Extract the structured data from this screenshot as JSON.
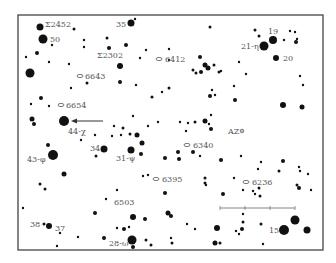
{
  "chart_title": "Star field finder chart",
  "frame": {
    "x": 18,
    "y": 15,
    "w": 305,
    "h": 235,
    "stroke": "#444444"
  },
  "colors": {
    "star": "#111111",
    "label": "#555555",
    "arrow": "#333333",
    "scale": "#777777"
  },
  "labels": [
    {
      "text": "Σ2452",
      "x": 45,
      "y": 27
    },
    {
      "text": "50",
      "x": 50,
      "y": 42
    },
    {
      "text": "35",
      "x": 116,
      "y": 27
    },
    {
      "text": "Σ2302",
      "x": 97,
      "y": 58
    },
    {
      "text": "6412",
      "x": 165,
      "y": 62
    },
    {
      "text": "19",
      "x": 268,
      "y": 34
    },
    {
      "text": "21-η",
      "x": 241,
      "y": 49
    },
    {
      "text": "20",
      "x": 283,
      "y": 61
    },
    {
      "text": "6643",
      "x": 85,
      "y": 79
    },
    {
      "text": "6654",
      "x": 66,
      "y": 108
    },
    {
      "text": "44-χ",
      "x": 68,
      "y": 134
    },
    {
      "text": "AZ",
      "x": 228,
      "y": 134
    },
    {
      "text": "34",
      "x": 90,
      "y": 151
    },
    {
      "text": "31-ψ",
      "x": 116,
      "y": 161
    },
    {
      "text": "6340",
      "x": 193,
      "y": 148
    },
    {
      "text": "43-φ",
      "x": 27,
      "y": 162
    },
    {
      "text": "6395",
      "x": 162,
      "y": 182
    },
    {
      "text": "6236",
      "x": 252,
      "y": 185
    },
    {
      "text": "6503",
      "x": 114,
      "y": 205
    },
    {
      "text": "38",
      "x": 30,
      "y": 227
    },
    {
      "text": "37",
      "x": 55,
      "y": 231
    },
    {
      "text": "15",
      "x": 269,
      "y": 233
    },
    {
      "text": "28-ω",
      "x": 109,
      "y": 246
    }
  ],
  "nebulae": [
    {
      "id": "6643",
      "x": 80,
      "y": 76
    },
    {
      "id": "6654",
      "x": 61,
      "y": 105
    },
    {
      "id": "6340",
      "x": 187,
      "y": 145
    },
    {
      "id": "6395",
      "x": 156,
      "y": 179
    },
    {
      "id": "6236",
      "x": 246,
      "y": 182
    },
    {
      "id": "6412",
      "x": 159,
      "y": 59
    }
  ],
  "stars": [
    {
      "x": 40,
      "y": 27,
      "r": 3.5
    },
    {
      "x": 43,
      "y": 39,
      "r": 4.5
    },
    {
      "x": 52,
      "y": 45,
      "r": 1.2
    },
    {
      "x": 74,
      "y": 29,
      "r": 1.5
    },
    {
      "x": 131,
      "y": 23,
      "r": 3.5
    },
    {
      "x": 135,
      "y": 19,
      "r": 1.2
    },
    {
      "x": 84,
      "y": 40,
      "r": 1.2
    },
    {
      "x": 84,
      "y": 47,
      "r": 1.2
    },
    {
      "x": 107,
      "y": 38,
      "r": 1.5
    },
    {
      "x": 109,
      "y": 48,
      "r": 2
    },
    {
      "x": 126,
      "y": 45,
      "r": 2
    },
    {
      "x": 146,
      "y": 50,
      "r": 1.2
    },
    {
      "x": 37,
      "y": 53,
      "r": 2
    },
    {
      "x": 26,
      "y": 57,
      "r": 1.2
    },
    {
      "x": 49,
      "y": 62,
      "r": 1.2
    },
    {
      "x": 69,
      "y": 64,
      "r": 1.2
    },
    {
      "x": 30,
      "y": 73,
      "r": 4.5
    },
    {
      "x": 120,
      "y": 66,
      "r": 3
    },
    {
      "x": 140,
      "y": 58,
      "r": 1.2
    },
    {
      "x": 169,
      "y": 49,
      "r": 1.2
    },
    {
      "x": 169,
      "y": 60,
      "r": 1.2
    },
    {
      "x": 210,
      "y": 27,
      "r": 1.5
    },
    {
      "x": 255,
      "y": 30,
      "r": 1.5
    },
    {
      "x": 259,
      "y": 36,
      "r": 1.5
    },
    {
      "x": 273,
      "y": 40,
      "r": 4
    },
    {
      "x": 264,
      "y": 46,
      "r": 4.5
    },
    {
      "x": 284,
      "y": 40,
      "r": 1.2
    },
    {
      "x": 290,
      "y": 31,
      "r": 1.2
    },
    {
      "x": 295,
      "y": 32,
      "r": 1.2
    },
    {
      "x": 297,
      "y": 39,
      "r": 1.2
    },
    {
      "x": 296,
      "y": 42,
      "r": 2
    },
    {
      "x": 276,
      "y": 58,
      "r": 3
    },
    {
      "x": 200,
      "y": 57,
      "r": 2
    },
    {
      "x": 205,
      "y": 65,
      "r": 2.5
    },
    {
      "x": 214,
      "y": 65,
      "r": 1.5
    },
    {
      "x": 219,
      "y": 72,
      "r": 1.5
    },
    {
      "x": 193,
      "y": 70,
      "r": 1.5
    },
    {
      "x": 196,
      "y": 73,
      "r": 1.5
    },
    {
      "x": 201,
      "y": 72,
      "r": 2
    },
    {
      "x": 208,
      "y": 68,
      "r": 2.5
    },
    {
      "x": 221,
      "y": 71,
      "r": 1.2
    },
    {
      "x": 239,
      "y": 62,
      "r": 1.2
    },
    {
      "x": 246,
      "y": 74,
      "r": 1.2
    },
    {
      "x": 300,
      "y": 76,
      "r": 1.2
    },
    {
      "x": 303,
      "y": 85,
      "r": 1.2
    },
    {
      "x": 169,
      "y": 88,
      "r": 1.5
    },
    {
      "x": 212,
      "y": 90,
      "r": 1.2
    },
    {
      "x": 210,
      "y": 96,
      "r": 2
    },
    {
      "x": 215,
      "y": 95,
      "r": 1.2
    },
    {
      "x": 234,
      "y": 86,
      "r": 1.2
    },
    {
      "x": 235,
      "y": 100,
      "r": 2
    },
    {
      "x": 283,
      "y": 105,
      "r": 3
    },
    {
      "x": 302,
      "y": 107,
      "r": 2.5
    },
    {
      "x": 120,
      "y": 82,
      "r": 2
    },
    {
      "x": 136,
      "y": 85,
      "r": 1.2
    },
    {
      "x": 71,
      "y": 88,
      "r": 1.2
    },
    {
      "x": 87,
      "y": 83,
      "r": 1.5
    },
    {
      "x": 152,
      "y": 97,
      "r": 1.5
    },
    {
      "x": 41,
      "y": 98,
      "r": 2
    },
    {
      "x": 31,
      "y": 104,
      "r": 1.2
    },
    {
      "x": 49,
      "y": 106,
      "r": 1.2
    },
    {
      "x": 32,
      "y": 119,
      "r": 2.5
    },
    {
      "x": 34,
      "y": 124,
      "r": 2
    },
    {
      "x": 64,
      "y": 121,
      "r": 5
    },
    {
      "x": 133,
      "y": 116,
      "r": 1.2
    },
    {
      "x": 162,
      "y": 92,
      "r": 1.2
    },
    {
      "x": 148,
      "y": 126,
      "r": 1.2
    },
    {
      "x": 158,
      "y": 122,
      "r": 1.2
    },
    {
      "x": 211,
      "y": 129,
      "r": 2
    },
    {
      "x": 209,
      "y": 124,
      "r": 1.2
    },
    {
      "x": 205,
      "y": 121,
      "r": 2.5
    },
    {
      "x": 211,
      "y": 115,
      "r": 1.2
    },
    {
      "x": 188,
      "y": 123,
      "r": 1.2
    },
    {
      "x": 180,
      "y": 122,
      "r": 1.2
    },
    {
      "x": 186,
      "y": 131,
      "r": 1.2
    },
    {
      "x": 195,
      "y": 122,
      "r": 1.5
    },
    {
      "x": 123,
      "y": 128,
      "r": 1.5
    },
    {
      "x": 114,
      "y": 126,
      "r": 1.2
    },
    {
      "x": 121,
      "y": 135,
      "r": 1.2
    },
    {
      "x": 130,
      "y": 134,
      "r": 1.5
    },
    {
      "x": 137,
      "y": 135,
      "r": 2.5
    },
    {
      "x": 112,
      "y": 136,
      "r": 1.2
    },
    {
      "x": 95,
      "y": 135,
      "r": 1.2
    },
    {
      "x": 81,
      "y": 140,
      "r": 1.2
    },
    {
      "x": 48,
      "y": 145,
      "r": 2
    },
    {
      "x": 104,
      "y": 149,
      "r": 3.5
    },
    {
      "x": 96,
      "y": 156,
      "r": 1.5
    },
    {
      "x": 131,
      "y": 150,
      "r": 3.5
    },
    {
      "x": 142,
      "y": 143,
      "r": 2.5
    },
    {
      "x": 141,
      "y": 154,
      "r": 2
    },
    {
      "x": 165,
      "y": 158,
      "r": 2
    },
    {
      "x": 178,
      "y": 152,
      "r": 2
    },
    {
      "x": 193,
      "y": 152,
      "r": 2
    },
    {
      "x": 179,
      "y": 159,
      "r": 2
    },
    {
      "x": 200,
      "y": 156,
      "r": 1.2
    },
    {
      "x": 221,
      "y": 160,
      "r": 2
    },
    {
      "x": 241,
      "y": 156,
      "r": 1.2
    },
    {
      "x": 261,
      "y": 162,
      "r": 1.2
    },
    {
      "x": 283,
      "y": 161,
      "r": 2
    },
    {
      "x": 258,
      "y": 169,
      "r": 1.2
    },
    {
      "x": 279,
      "y": 171,
      "r": 1.5
    },
    {
      "x": 299,
      "y": 167,
      "r": 1.2
    },
    {
      "x": 300,
      "y": 171,
      "r": 1.2
    },
    {
      "x": 308,
      "y": 174,
      "r": 1.2
    },
    {
      "x": 53,
      "y": 155,
      "r": 5
    },
    {
      "x": 64,
      "y": 174,
      "r": 2.5
    },
    {
      "x": 40,
      "y": 184,
      "r": 1.5
    },
    {
      "x": 45,
      "y": 189,
      "r": 1.5
    },
    {
      "x": 143,
      "y": 176,
      "r": 1.2
    },
    {
      "x": 148,
      "y": 175,
      "r": 1.2
    },
    {
      "x": 165,
      "y": 193,
      "r": 2
    },
    {
      "x": 205,
      "y": 178,
      "r": 1.5
    },
    {
      "x": 205,
      "y": 183,
      "r": 1.5
    },
    {
      "x": 206,
      "y": 185,
      "r": 1.2
    },
    {
      "x": 234,
      "y": 178,
      "r": 1.2
    },
    {
      "x": 243,
      "y": 190,
      "r": 1.2
    },
    {
      "x": 253,
      "y": 191,
      "r": 1.2
    },
    {
      "x": 259,
      "y": 188,
      "r": 1.5
    },
    {
      "x": 260,
      "y": 196,
      "r": 1.5
    },
    {
      "x": 255,
      "y": 194,
      "r": 1.2
    },
    {
      "x": 297,
      "y": 185,
      "r": 1.5
    },
    {
      "x": 299,
      "y": 188,
      "r": 2
    },
    {
      "x": 311,
      "y": 190,
      "r": 1.2
    },
    {
      "x": 223,
      "y": 194,
      "r": 2
    },
    {
      "x": 117,
      "y": 190,
      "r": 1.2
    },
    {
      "x": 106,
      "y": 199,
      "r": 1.2
    },
    {
      "x": 23,
      "y": 208,
      "r": 1.2
    },
    {
      "x": 95,
      "y": 213,
      "r": 2
    },
    {
      "x": 133,
      "y": 217,
      "r": 3
    },
    {
      "x": 145,
      "y": 219,
      "r": 2
    },
    {
      "x": 168,
      "y": 213,
      "r": 2.5
    },
    {
      "x": 171,
      "y": 216,
      "r": 2
    },
    {
      "x": 243,
      "y": 214,
      "r": 1.2
    },
    {
      "x": 243,
      "y": 222,
      "r": 1.5
    },
    {
      "x": 187,
      "y": 224,
      "r": 1.2
    },
    {
      "x": 195,
      "y": 229,
      "r": 1.2
    },
    {
      "x": 217,
      "y": 228,
      "r": 3
    },
    {
      "x": 236,
      "y": 231,
      "r": 1.2
    },
    {
      "x": 242,
      "y": 229,
      "r": 2
    },
    {
      "x": 239,
      "y": 234,
      "r": 1.2
    },
    {
      "x": 261,
      "y": 224,
      "r": 1.5
    },
    {
      "x": 295,
      "y": 220,
      "r": 4.5
    },
    {
      "x": 284,
      "y": 230,
      "r": 5
    },
    {
      "x": 307,
      "y": 230,
      "r": 3.5
    },
    {
      "x": 44,
      "y": 224,
      "r": 1.5
    },
    {
      "x": 49,
      "y": 226,
      "r": 3
    },
    {
      "x": 60,
      "y": 233,
      "r": 1.2
    },
    {
      "x": 57,
      "y": 246,
      "r": 1.2
    },
    {
      "x": 78,
      "y": 237,
      "r": 1.2
    },
    {
      "x": 117,
      "y": 228,
      "r": 1.2
    },
    {
      "x": 124,
      "y": 229,
      "r": 2
    },
    {
      "x": 129,
      "y": 227,
      "r": 1.2
    },
    {
      "x": 104,
      "y": 238,
      "r": 2
    },
    {
      "x": 132,
      "y": 240,
      "r": 4.5
    },
    {
      "x": 133,
      "y": 247,
      "r": 2
    },
    {
      "x": 146,
      "y": 240,
      "r": 1.5
    },
    {
      "x": 151,
      "y": 245,
      "r": 1.5
    },
    {
      "x": 171,
      "y": 238,
      "r": 1.2
    },
    {
      "x": 172,
      "y": 243,
      "r": 1.5
    },
    {
      "x": 215,
      "y": 243,
      "r": 2.5
    },
    {
      "x": 220,
      "y": 243,
      "r": 1.5
    },
    {
      "x": 263,
      "y": 244,
      "r": 1.2
    }
  ],
  "arrow": {
    "x1": 103,
    "y1": 121,
    "x2": 71,
    "y2": 121
  },
  "scale_bar": {
    "x1": 220,
    "y1": 208,
    "x2": 295,
    "y2": 208,
    "ticks": [
      220,
      245,
      270,
      295
    ]
  },
  "az_marker": {
    "x": 242,
    "y": 131
  }
}
